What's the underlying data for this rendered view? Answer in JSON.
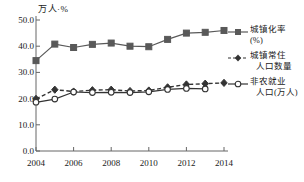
{
  "chart_data": {
    "type": "line",
    "title": "",
    "ylabel": "万人·%",
    "xlabel": "",
    "axis_unit_label": "万人·%",
    "categories": [
      2004,
      2005,
      2006,
      2007,
      2008,
      2009,
      2010,
      2011,
      2012,
      2013,
      2014
    ],
    "x": [
      2004,
      2005,
      2006,
      2007,
      2008,
      2009,
      2010,
      2011,
      2012,
      2013,
      2014
    ],
    "xlim": [
      2004,
      2014
    ],
    "ylim": [
      0.0,
      50.0
    ],
    "yticks": [
      "0.0",
      "10.0",
      "20.0",
      "30.0",
      "40.0",
      "50.0"
    ],
    "ytick_values": [
      0.0,
      10.0,
      20.0,
      30.0,
      40.0,
      50.0
    ],
    "xticks": [
      "2004",
      "2006",
      "2008",
      "2010",
      "2012",
      "2014"
    ],
    "xtick_values": [
      2004,
      2006,
      2008,
      2010,
      2012,
      2014
    ],
    "grid": false,
    "legend_position": "right",
    "series": [
      {
        "name": "城镇化率(%)",
        "marker": "square",
        "line": "solid",
        "color": "#595959",
        "values": [
          34.5,
          40.8,
          39.5,
          40.7,
          41.2,
          40.0,
          39.8,
          42.6,
          45.0,
          45.3,
          46.0
        ]
      },
      {
        "name": "城镇常住人口数量",
        "marker": "diamond",
        "line": "dashed",
        "color": "#333333",
        "values": [
          19.9,
          23.4,
          22.7,
          23.2,
          23.4,
          22.9,
          23.1,
          24.3,
          25.4,
          25.7,
          26.0
        ]
      },
      {
        "name": "非农就业人口(万人)",
        "marker": "circle-open",
        "line": "solid",
        "color": "#333333",
        "values": [
          18.6,
          19.8,
          22.5,
          22.3,
          22.4,
          22.3,
          22.6,
          23.5,
          23.9,
          23.7,
          null
        ]
      }
    ]
  },
  "legend": {
    "items": [
      {
        "label_line1": "城镇化率",
        "label_line2": "(%)",
        "marker": "square",
        "line": "solid"
      },
      {
        "label_line1": "城镇常住",
        "label_line2": "人口数量",
        "marker": "diamond",
        "line": "dashed"
      },
      {
        "label_line1": "非农就业",
        "label_line2": "人口(万人)",
        "marker": "circle-open",
        "line": "solid"
      }
    ]
  }
}
